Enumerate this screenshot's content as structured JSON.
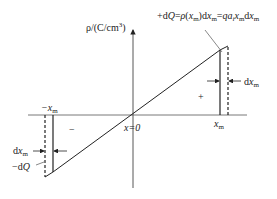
{
  "diagram": {
    "y_axis_label": {
      "base": "ρ/(C/cm",
      "sup": "3",
      "end": ")"
    },
    "origin_label": "x=0",
    "pos_xm_label": "x",
    "pos_xm_sub": "m",
    "neg_xm_label": "−x",
    "neg_xm_sub": "m",
    "plus_sign": "+",
    "minus_sign": "−",
    "top_annotation": "+dQ=ρ(xm)dxm=qaixmdxm",
    "top_annotation_parts": [
      "+d",
      "Q",
      "=",
      "ρ",
      "(",
      "x",
      "m",
      ")d",
      "x",
      "m",
      "=",
      "qa",
      "i",
      "x",
      "m",
      "d",
      "x",
      "m"
    ],
    "right_dx": {
      "pre": "d",
      "var": "x",
      "sub": "m"
    },
    "left_dx": {
      "pre": "d",
      "var": "x",
      "sub": "m"
    },
    "left_dq": {
      "pre": "−d",
      "var": "Q"
    }
  }
}
